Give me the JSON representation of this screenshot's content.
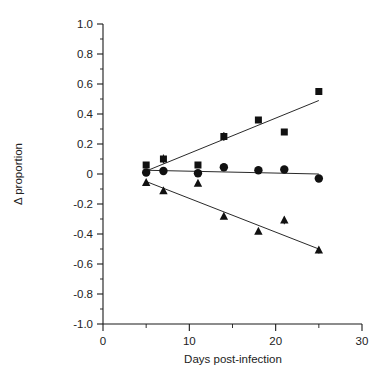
{
  "chart_data": {
    "type": "scatter",
    "title": "",
    "subtitle": "",
    "xlabel": "Days post-infection",
    "ylabel": "Δ proportion",
    "xlim": [
      0,
      30
    ],
    "ylim": [
      -1.0,
      1.0
    ],
    "grid": false,
    "legend": "none",
    "x_ticks_major": [
      0,
      10,
      20,
      30
    ],
    "x_tick_labels": [
      "0",
      "10",
      "20",
      "30"
    ],
    "x_ticks_minor": [
      5,
      15,
      25
    ],
    "y_ticks_major": [
      1.0,
      0.8,
      0.6,
      0.4,
      0.2,
      0,
      -0.2,
      -0.4,
      -0.6,
      -0.8,
      -1.0
    ],
    "y_tick_labels": [
      "1.0",
      "0.8",
      "0.6",
      "0.4",
      "0.2",
      "0",
      "-0.2",
      "-0.4",
      "-0.6",
      "-0.8",
      "-1.0"
    ],
    "y_ticks_minor": [
      0.9,
      0.7,
      0.5,
      0.3,
      0.1,
      -0.1,
      -0.3,
      -0.5,
      -0.7,
      -0.9
    ],
    "x": [
      5,
      7,
      11,
      14,
      18,
      21,
      25
    ],
    "series": [
      {
        "name": "squares",
        "marker": "square",
        "color": "#111111",
        "values": [
          0.06,
          0.1,
          0.06,
          0.25,
          0.36,
          0.28,
          0.55
        ],
        "errors": [
          0.02,
          0.03,
          0.0,
          0.03,
          0.0,
          0.0,
          0.02
        ],
        "trendline": {
          "x0": 5,
          "y0": 0.02,
          "x1": 25,
          "y1": 0.49
        }
      },
      {
        "name": "circles",
        "marker": "circle",
        "color": "#111111",
        "values": [
          0.01,
          0.02,
          0.005,
          0.045,
          0.025,
          0.03,
          -0.03
        ],
        "errors": [
          0.0,
          0.0,
          0.0,
          0.0,
          0.0,
          0.0,
          0.0
        ],
        "trendline": {
          "x0": 5,
          "y0": 0.025,
          "x1": 25,
          "y1": 0.0
        }
      },
      {
        "name": "triangles",
        "marker": "triangle",
        "color": "#111111",
        "values": [
          -0.06,
          -0.115,
          -0.065,
          -0.285,
          -0.385,
          -0.31,
          -0.51
        ],
        "errors": [
          0.0,
          0.0,
          0.0,
          0.0,
          0.0,
          0.025,
          0.02
        ],
        "trendline": {
          "x0": 5,
          "y0": -0.05,
          "x1": 25,
          "y1": -0.5
        }
      }
    ]
  },
  "figure": {
    "background_color": "#ffffff",
    "axis_color": "#1a1a1a",
    "marker_color": "#111111"
  }
}
